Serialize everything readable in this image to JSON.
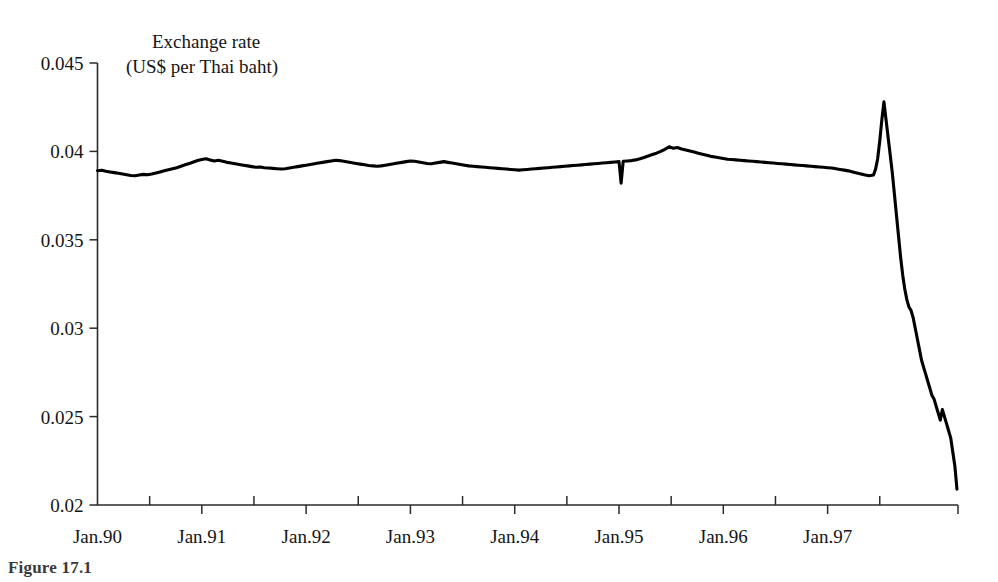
{
  "figure": {
    "caption_fragment": "Figure 17.1"
  },
  "chart_data": {
    "type": "line",
    "title": "Exchange rate",
    "subtitle": "(US$ per Thai baht)",
    "xlabel": "",
    "ylabel": "",
    "ylim": [
      0.02,
      0.045
    ],
    "xlim": [
      "Jan.90",
      "Apr.98"
    ],
    "grid": false,
    "legend": "none",
    "ytick_labels": [
      "0.045",
      "0.04",
      "0.035",
      "0.03",
      "0.025",
      "0.02"
    ],
    "ytick_values": [
      0.045,
      0.04,
      0.035,
      0.03,
      0.025,
      0.02
    ],
    "xtick_labels": [
      "Jan.90",
      "Jan.91",
      "Jan.92",
      "Jan.93",
      "Jan.94",
      "Jan.95",
      "Jan.96",
      "Jan.97"
    ],
    "xtick_values": [
      1990.0,
      1991.0,
      1992.0,
      1993.0,
      1994.0,
      1995.0,
      1996.0,
      1997.0
    ],
    "minor_xtick_values": [
      1990.5,
      1991.5,
      1992.5,
      1993.5,
      1994.5,
      1995.5,
      1996.5,
      1997.5
    ],
    "series": [
      {
        "name": "US$ per Thai baht",
        "color": "#000000",
        "x": [
          1990.0,
          1990.04,
          1990.08,
          1990.12,
          1990.16,
          1990.2,
          1990.24,
          1990.28,
          1990.32,
          1990.36,
          1990.4,
          1990.44,
          1990.48,
          1990.52,
          1990.56,
          1990.6,
          1990.64,
          1990.68,
          1990.72,
          1990.76,
          1990.8,
          1990.84,
          1990.88,
          1990.92,
          1990.96,
          1991.0,
          1991.04,
          1991.08,
          1991.12,
          1991.16,
          1991.2,
          1991.24,
          1991.28,
          1991.32,
          1991.36,
          1991.4,
          1991.44,
          1991.48,
          1991.52,
          1991.56,
          1991.6,
          1991.64,
          1991.68,
          1991.72,
          1991.76,
          1991.8,
          1991.84,
          1991.88,
          1991.92,
          1991.96,
          1992.0,
          1992.04,
          1992.08,
          1992.12,
          1992.16,
          1992.2,
          1992.24,
          1992.28,
          1992.32,
          1992.36,
          1992.4,
          1992.44,
          1992.48,
          1992.52,
          1992.56,
          1992.6,
          1992.64,
          1992.68,
          1992.72,
          1992.76,
          1992.8,
          1992.84,
          1992.88,
          1992.92,
          1992.96,
          1993.0,
          1993.04,
          1993.08,
          1993.12,
          1993.16,
          1993.2,
          1993.24,
          1993.28,
          1993.32,
          1993.36,
          1993.4,
          1993.44,
          1993.48,
          1993.52,
          1993.56,
          1993.6,
          1993.64,
          1993.68,
          1993.72,
          1993.76,
          1993.8,
          1993.84,
          1993.88,
          1993.92,
          1993.96,
          1994.0,
          1994.04,
          1994.08,
          1994.12,
          1994.16,
          1994.2,
          1994.24,
          1994.28,
          1994.32,
          1994.36,
          1994.4,
          1994.44,
          1994.48,
          1994.52,
          1994.56,
          1994.6,
          1994.64,
          1994.68,
          1994.72,
          1994.76,
          1994.8,
          1994.84,
          1994.88,
          1994.92,
          1994.96,
          1995.0,
          1995.02,
          1995.04,
          1995.08,
          1995.12,
          1995.16,
          1995.2,
          1995.24,
          1995.28,
          1995.32,
          1995.36,
          1995.4,
          1995.44,
          1995.48,
          1995.52,
          1995.56,
          1995.6,
          1995.64,
          1995.68,
          1995.72,
          1995.76,
          1995.8,
          1995.84,
          1995.88,
          1995.92,
          1995.96,
          1996.0,
          1996.04,
          1996.08,
          1996.12,
          1996.16,
          1996.2,
          1996.24,
          1996.28,
          1996.32,
          1996.36,
          1996.4,
          1996.44,
          1996.48,
          1996.52,
          1996.56,
          1996.6,
          1996.64,
          1996.68,
          1996.72,
          1996.76,
          1996.8,
          1996.84,
          1996.88,
          1996.92,
          1996.96,
          1997.0,
          1997.04,
          1997.08,
          1997.12,
          1997.16,
          1997.2,
          1997.24,
          1997.28,
          1997.32,
          1997.36,
          1997.4,
          1997.44,
          1997.46,
          1997.48,
          1997.5,
          1997.52,
          1997.54,
          1997.56,
          1997.58,
          1997.6,
          1997.62,
          1997.64,
          1997.66,
          1997.68,
          1997.7,
          1997.72,
          1997.74,
          1997.76,
          1997.78,
          1997.8,
          1997.82,
          1997.84,
          1997.86,
          1997.88,
          1997.9,
          1997.92,
          1997.94,
          1997.96,
          1997.98,
          1998.0,
          1998.02,
          1998.04,
          1998.06,
          1998.08,
          1998.1,
          1998.12,
          1998.14,
          1998.16,
          1998.18,
          1998.2,
          1998.22,
          1998.24
        ],
        "values": [
          0.03891,
          0.03893,
          0.03888,
          0.03884,
          0.0388,
          0.03876,
          0.03872,
          0.03868,
          0.03864,
          0.03862,
          0.03866,
          0.0387,
          0.03868,
          0.03872,
          0.03878,
          0.03884,
          0.0389,
          0.03896,
          0.03902,
          0.03908,
          0.03916,
          0.03924,
          0.03932,
          0.0394,
          0.03948,
          0.03954,
          0.03958,
          0.03952,
          0.03946,
          0.0395,
          0.03944,
          0.03938,
          0.03934,
          0.0393,
          0.03926,
          0.03922,
          0.03918,
          0.03914,
          0.0391,
          0.03912,
          0.03908,
          0.03906,
          0.03904,
          0.03902,
          0.039,
          0.03902,
          0.03906,
          0.0391,
          0.03914,
          0.03918,
          0.03922,
          0.03926,
          0.0393,
          0.03934,
          0.03938,
          0.03942,
          0.03946,
          0.0395,
          0.03948,
          0.03944,
          0.0394,
          0.03936,
          0.03932,
          0.03928,
          0.03924,
          0.0392,
          0.03918,
          0.03916,
          0.03918,
          0.03922,
          0.03926,
          0.0393,
          0.03934,
          0.03938,
          0.03942,
          0.03946,
          0.03944,
          0.0394,
          0.03936,
          0.03932,
          0.0393,
          0.03934,
          0.03938,
          0.03942,
          0.03938,
          0.03934,
          0.0393,
          0.03926,
          0.03922,
          0.03918,
          0.03916,
          0.03914,
          0.03912,
          0.0391,
          0.03908,
          0.03906,
          0.03904,
          0.03902,
          0.039,
          0.03898,
          0.03896,
          0.03894,
          0.03896,
          0.03898,
          0.039,
          0.03902,
          0.03904,
          0.03906,
          0.03908,
          0.0391,
          0.03912,
          0.03914,
          0.03916,
          0.03918,
          0.0392,
          0.03922,
          0.03924,
          0.03926,
          0.03928,
          0.0393,
          0.03932,
          0.03934,
          0.03936,
          0.03938,
          0.0394,
          0.03942,
          0.0382,
          0.03944,
          0.03946,
          0.03948,
          0.03952,
          0.03958,
          0.03966,
          0.03974,
          0.03982,
          0.0399,
          0.04,
          0.04012,
          0.04026,
          0.04018,
          0.04022,
          0.04014,
          0.04008,
          0.04002,
          0.03996,
          0.0399,
          0.03984,
          0.03978,
          0.03972,
          0.03968,
          0.03964,
          0.0396,
          0.03956,
          0.03954,
          0.03952,
          0.0395,
          0.03948,
          0.03946,
          0.03944,
          0.03942,
          0.0394,
          0.03938,
          0.03936,
          0.03934,
          0.03932,
          0.0393,
          0.03928,
          0.03926,
          0.03924,
          0.03922,
          0.0392,
          0.03918,
          0.03916,
          0.03914,
          0.03912,
          0.0391,
          0.03908,
          0.03906,
          0.03902,
          0.03898,
          0.03894,
          0.0389,
          0.03884,
          0.03878,
          0.03872,
          0.03866,
          0.03862,
          0.03866,
          0.039,
          0.0396,
          0.0406,
          0.0418,
          0.0428,
          0.0418,
          0.0408,
          0.0398,
          0.0388,
          0.0376,
          0.0364,
          0.0352,
          0.034,
          0.033,
          0.0322,
          0.0316,
          0.0312,
          0.031,
          0.0306,
          0.03,
          0.0294,
          0.0288,
          0.0282,
          0.0278,
          0.0274,
          0.027,
          0.0266,
          0.0262,
          0.026,
          0.0256,
          0.0252,
          0.0248,
          0.0254,
          0.025,
          0.0246,
          0.0242,
          0.0238,
          0.023,
          0.0222,
          0.0209
        ]
      }
    ]
  }
}
